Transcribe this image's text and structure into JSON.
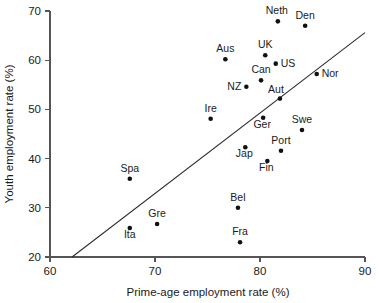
{
  "chart_data": {
    "type": "scatter",
    "title": "",
    "xlabel": "Prime-age employment rate (%)",
    "ylabel": "Youth employment rate (%)",
    "xlim": [
      60,
      90
    ],
    "ylim": [
      20,
      70
    ],
    "xticks": [
      60,
      70,
      80,
      90
    ],
    "yticks": [
      20,
      30,
      40,
      50,
      60,
      70
    ],
    "grid": false,
    "legend": false,
    "points": [
      {
        "label": "Neth",
        "x": 81.7,
        "y": 67.9,
        "label_dx": -1,
        "label_dy": -7,
        "label_anchor": "middle"
      },
      {
        "label": "Den",
        "x": 84.3,
        "y": 67.0,
        "label_dx": 0,
        "label_dy": -7,
        "label_anchor": "middle"
      },
      {
        "label": "Aus",
        "x": 76.7,
        "y": 60.2,
        "label_dx": 0,
        "label_dy": -7,
        "label_anchor": "middle"
      },
      {
        "label": "UK",
        "x": 80.5,
        "y": 61.0,
        "label_dx": 0,
        "label_dy": -7,
        "label_anchor": "middle"
      },
      {
        "label": "US",
        "x": 81.5,
        "y": 59.3,
        "label_dx": 5,
        "label_dy": 3.5,
        "label_anchor": "start"
      },
      {
        "label": "Can",
        "x": 80.1,
        "y": 55.9,
        "label_dx": 0,
        "label_dy": -7,
        "label_anchor": "middle"
      },
      {
        "label": "Nor",
        "x": 85.4,
        "y": 57.2,
        "label_dx": 5,
        "label_dy": 3.5,
        "label_anchor": "start"
      },
      {
        "label": "NZ",
        "x": 78.7,
        "y": 54.6,
        "label_dx": -5,
        "label_dy": 3.5,
        "label_anchor": "end"
      },
      {
        "label": "Aut",
        "x": 81.9,
        "y": 52.2,
        "label_dx": -4,
        "label_dy": -6,
        "label_anchor": "middle"
      },
      {
        "label": "Ire",
        "x": 75.3,
        "y": 48.1,
        "label_dx": 0,
        "label_dy": -7,
        "label_anchor": "middle"
      },
      {
        "label": "Ger",
        "x": 80.3,
        "y": 48.3,
        "label_dx": -1,
        "label_dy": 10,
        "label_anchor": "middle"
      },
      {
        "label": "Swe",
        "x": 84.0,
        "y": 45.8,
        "label_dx": 0,
        "label_dy": -7,
        "label_anchor": "middle"
      },
      {
        "label": "Jap",
        "x": 78.6,
        "y": 42.3,
        "label_dx": -1,
        "label_dy": 10,
        "label_anchor": "middle"
      },
      {
        "label": "Port",
        "x": 82.0,
        "y": 41.6,
        "label_dx": 0,
        "label_dy": -7,
        "label_anchor": "middle"
      },
      {
        "label": "Fin",
        "x": 80.7,
        "y": 39.5,
        "label_dx": -1,
        "label_dy": 10,
        "label_anchor": "middle"
      },
      {
        "label": "Spa",
        "x": 67.6,
        "y": 35.9,
        "label_dx": 0,
        "label_dy": -7,
        "label_anchor": "middle"
      },
      {
        "label": "Bel",
        "x": 77.9,
        "y": 30.0,
        "label_dx": 0,
        "label_dy": -7,
        "label_anchor": "middle"
      },
      {
        "label": "Gre",
        "x": 70.2,
        "y": 26.7,
        "label_dx": 0,
        "label_dy": -7,
        "label_anchor": "middle"
      },
      {
        "label": "Ita",
        "x": 67.6,
        "y": 25.9,
        "label_dx": 0,
        "label_dy": 10,
        "label_anchor": "middle"
      },
      {
        "label": "Fra",
        "x": 78.1,
        "y": 23.0,
        "label_dx": 0,
        "label_dy": -7,
        "label_anchor": "middle"
      }
    ],
    "trend_line": {
      "x0": 62.1,
      "y0": 20.0,
      "x1": 90.0,
      "y1": 65.6
    }
  },
  "colors": {
    "axis": "#555555",
    "marker": "#111111",
    "trend": "#2b2b2b",
    "text": "#1a1a1a",
    "background": "#ffffff"
  }
}
